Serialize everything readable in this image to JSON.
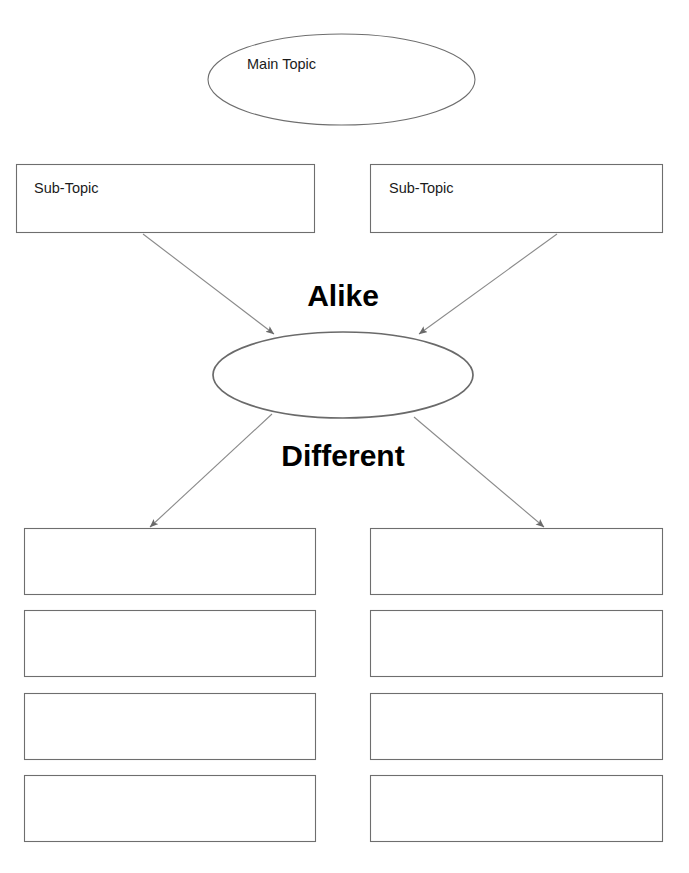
{
  "document": {
    "type": "compare-and-contrast-graphic-organizer",
    "background_color": "#ffffff"
  },
  "nodes": {
    "main_topic": {
      "label": "Main Topic",
      "shape": "ellipse",
      "cx": 341.5,
      "cy": 79.5,
      "rx": 133.5,
      "ry": 45.5,
      "stroke": "#6e6e6e",
      "stroke_width": 1.1,
      "fill": "#ffffff"
    },
    "sub_topic_left": {
      "label": "Sub-Topic",
      "shape": "rect",
      "x": 16,
      "y": 164,
      "width": 299,
      "height": 69,
      "stroke": "#6e6e6e",
      "stroke_width": 1.1,
      "fill": "#ffffff"
    },
    "sub_topic_right": {
      "label": "Sub-Topic",
      "shape": "rect",
      "x": 370,
      "y": 164,
      "width": 293,
      "height": 69,
      "stroke": "#6e6e6e",
      "stroke_width": 1.1,
      "fill": "#ffffff"
    },
    "center_circle": {
      "label": "",
      "shape": "ellipse",
      "cx": 343,
      "cy": 375,
      "rx": 130,
      "ry": 43,
      "stroke": "#6a6a6a",
      "stroke_width": 1.7,
      "fill": "#ffffff"
    }
  },
  "band_labels": {
    "alike": "Alike",
    "different": "Different"
  },
  "arrows": [
    {
      "name": "sub-topic-left-to-center",
      "x1": 143,
      "y1": 234,
      "x2": 274,
      "y2": 334
    },
    {
      "name": "sub-topic-right-to-center",
      "x1": 557,
      "y1": 234,
      "x2": 419,
      "y2": 334
    },
    {
      "name": "center-to-detail-left",
      "x1": 272,
      "y1": 414,
      "x2": 150,
      "y2": 527
    },
    {
      "name": "center-to-detail-right",
      "x1": 414,
      "y1": 417,
      "x2": 544,
      "y2": 527
    }
  ],
  "detail_boxes": {
    "stroke": "#6e6e6e",
    "stroke_width": 1.1,
    "fill": "#ffffff",
    "left_column": [
      {
        "name": "detail-box-left-1",
        "x": 24,
        "y": 528,
        "width": 292,
        "height": 67,
        "text": ""
      },
      {
        "name": "detail-box-left-2",
        "x": 24,
        "y": 610,
        "width": 292,
        "height": 67,
        "text": ""
      },
      {
        "name": "detail-box-left-3",
        "x": 24,
        "y": 693,
        "width": 292,
        "height": 67,
        "text": ""
      },
      {
        "name": "detail-box-left-4",
        "x": 24,
        "y": 775,
        "width": 292,
        "height": 67,
        "text": ""
      }
    ],
    "right_column": [
      {
        "name": "detail-box-right-1",
        "x": 370,
        "y": 528,
        "width": 293,
        "height": 67,
        "text": ""
      },
      {
        "name": "detail-box-right-2",
        "x": 370,
        "y": 610,
        "width": 293,
        "height": 67,
        "text": ""
      },
      {
        "name": "detail-box-right-3",
        "x": 370,
        "y": 693,
        "width": 293,
        "height": 67,
        "text": ""
      },
      {
        "name": "detail-box-right-4",
        "x": 370,
        "y": 775,
        "width": 293,
        "height": 67,
        "text": ""
      }
    ]
  }
}
